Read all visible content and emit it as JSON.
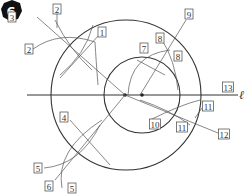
{
  "figure": {
    "step_number": "6",
    "line_label": "ℓ",
    "labels": [
      {
        "id": "l3a",
        "text": "3",
        "x": 12,
        "y": 17
      },
      {
        "id": "l2a",
        "text": "2",
        "x": 57,
        "y": 9
      },
      {
        "id": "l1",
        "text": "1",
        "x": 102,
        "y": 32
      },
      {
        "id": "l2b",
        "text": "2",
        "x": 29,
        "y": 49
      },
      {
        "id": "l9",
        "text": "9",
        "x": 189,
        "y": 14
      },
      {
        "id": "l8a",
        "text": "8",
        "x": 160,
        "y": 38
      },
      {
        "id": "l7",
        "text": "7",
        "x": 144,
        "y": 48
      },
      {
        "id": "l8b",
        "text": "8",
        "x": 178,
        "y": 56
      },
      {
        "id": "l13",
        "text": "13",
        "x": 228,
        "y": 87
      },
      {
        "id": "l4",
        "text": "4",
        "x": 64,
        "y": 117
      },
      {
        "id": "l11a",
        "text": "11",
        "x": 208,
        "y": 106
      },
      {
        "id": "l10",
        "text": "10",
        "x": 155,
        "y": 124
      },
      {
        "id": "l11b",
        "text": "11",
        "x": 182,
        "y": 127
      },
      {
        "id": "l12",
        "text": "12",
        "x": 224,
        "y": 134
      },
      {
        "id": "l5a",
        "text": "5",
        "x": 38,
        "y": 168
      },
      {
        "id": "l6",
        "text": "6",
        "x": 49,
        "y": 186
      },
      {
        "id": "l5b",
        "text": "5",
        "x": 72,
        "y": 188
      }
    ],
    "colors": {
      "line": "#333333",
      "badge": "#111111",
      "label_border": "#444444"
    }
  }
}
